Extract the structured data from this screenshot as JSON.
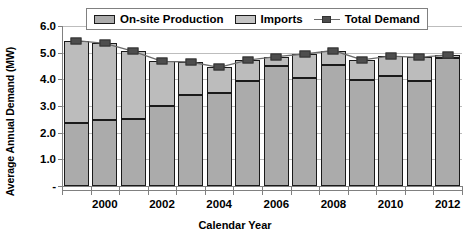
{
  "chart_data": {
    "type": "bar",
    "stacked": true,
    "title": "",
    "xlabel": "Calendar Year",
    "ylabel": "Average Annual Demand (MW)",
    "categories": [
      1999,
      2000,
      2001,
      2002,
      2003,
      2004,
      2005,
      2006,
      2007,
      2008,
      2009,
      2010,
      2011,
      2012
    ],
    "xtick_labels": [
      "2000",
      "2002",
      "2004",
      "2006",
      "2008",
      "2010",
      "2012"
    ],
    "xtick_values": [
      2000,
      2002,
      2004,
      2006,
      2008,
      2010,
      2012
    ],
    "ytick_labels": [
      "6.0",
      "5.0",
      "4.0",
      "3.0",
      "2.0",
      "1.0",
      "-"
    ],
    "ytick_values": [
      6.0,
      5.0,
      4.0,
      3.0,
      2.0,
      1.0,
      0.0
    ],
    "ylim": [
      0.0,
      6.0
    ],
    "grid": true,
    "legend_position": "top-center",
    "series": [
      {
        "name": "On-site Production",
        "kind": "bar-segment",
        "color": "#ababab",
        "values": [
          2.38,
          2.47,
          2.5,
          3.0,
          3.43,
          3.5,
          3.92,
          4.5,
          4.05,
          4.52,
          3.97,
          4.12,
          3.92,
          4.8
        ]
      },
      {
        "name": "Imports",
        "kind": "bar-segment",
        "color": "#bcbcbc",
        "values": [
          3.07,
          2.88,
          2.55,
          1.67,
          1.22,
          0.95,
          0.8,
          0.35,
          0.9,
          0.56,
          0.76,
          0.75,
          0.9,
          0.12
        ]
      },
      {
        "name": "Total Demand",
        "kind": "line-marker",
        "color": "#4d4d4d",
        "values": [
          5.45,
          5.35,
          5.05,
          4.67,
          4.65,
          4.45,
          4.72,
          4.85,
          4.95,
          5.08,
          4.73,
          4.87,
          4.82,
          4.92
        ]
      }
    ]
  },
  "legend": {
    "items": [
      {
        "label": "On-site Production",
        "swatch": "onsite-swatch"
      },
      {
        "label": "Imports",
        "swatch": "imports-swatch"
      },
      {
        "label": "Total Demand",
        "swatch": "line-marker-swatch"
      }
    ]
  }
}
